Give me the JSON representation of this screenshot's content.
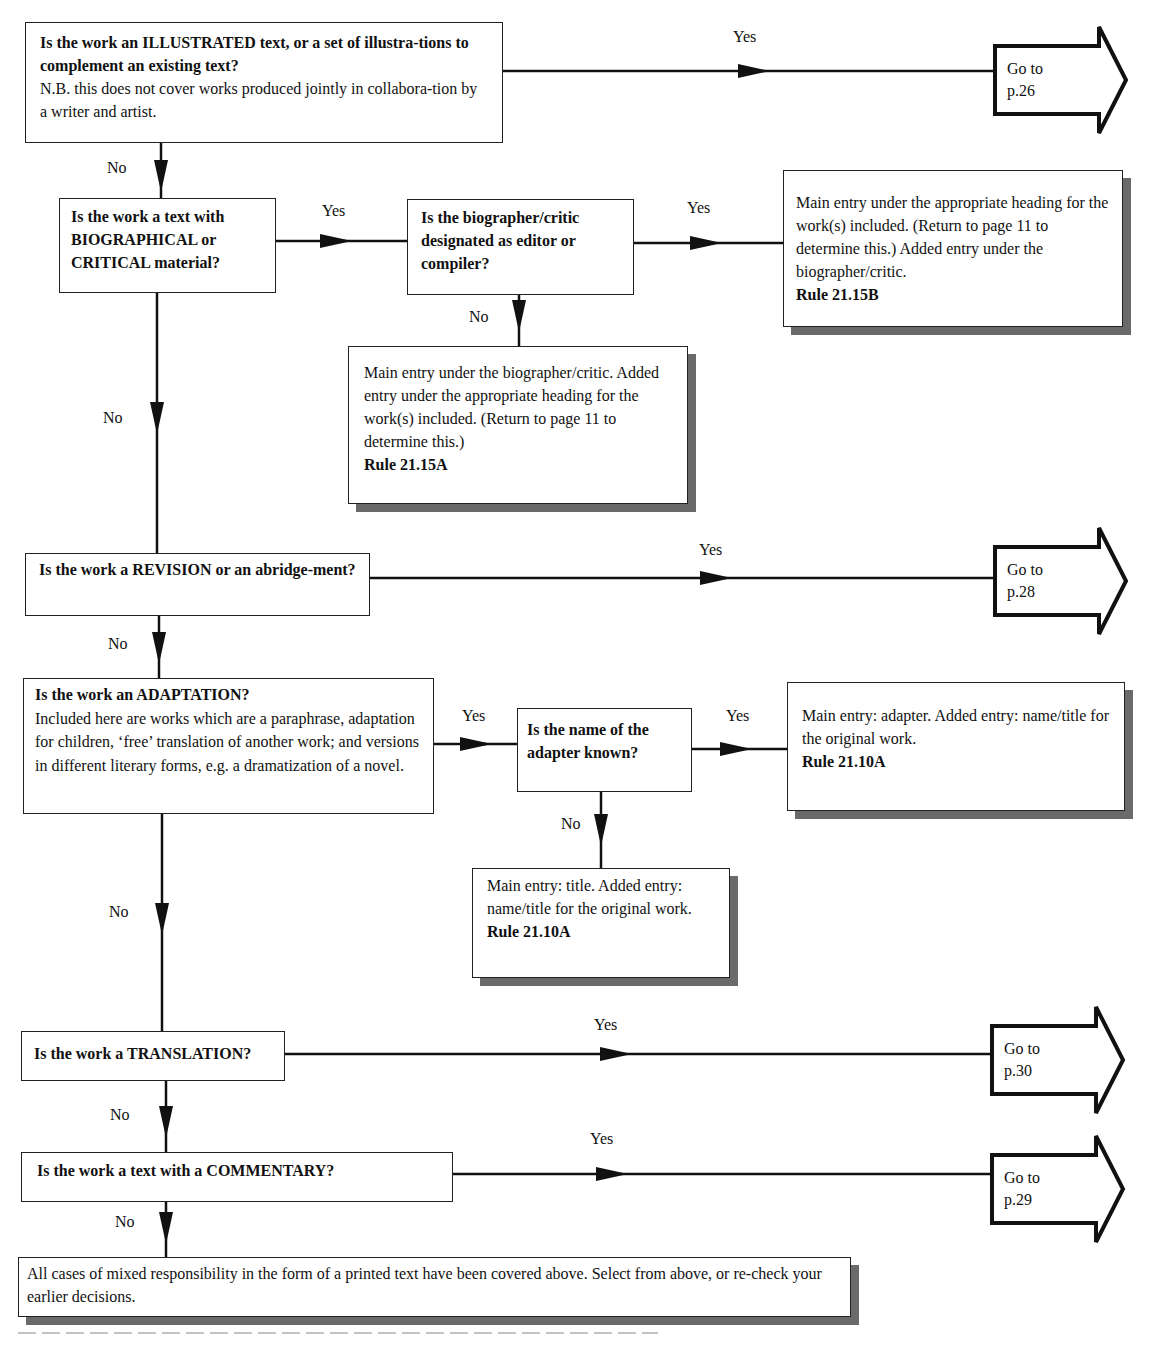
{
  "flowchart": {
    "nodes": {
      "illustrated": {
        "question": "Is the work  an ILLUSTRATED text, or a set of illustra-tions to complement an existing text?",
        "note": "N.B. this does not cover works produced jointly in collabora-tion by a writer and artist."
      },
      "biographical": {
        "question": "Is the work a text with BIOGRAPHICAL or CRITICAL material?"
      },
      "biographer_editor": {
        "question": "Is the biographer/critic designated as editor or compiler?"
      },
      "rule_21_15B": {
        "text": "Main entry under the appropriate heading for the work(s) included. (Return to page 11 to determine this.) Added entry under the biographer/critic.",
        "rule": "Rule 21.15B"
      },
      "rule_21_15A": {
        "text": "Main entry under the biographer/critic. Added entry under the appropriate heading for the work(s) included. (Return to page 11 to determine this.)",
        "rule": "Rule 21.15A"
      },
      "revision": {
        "question": "Is the work a REVISION or an abridge-ment?"
      },
      "adaptation": {
        "question": "Is the work an ADAPTATION?",
        "note": "Included here are works which are a paraphrase, adaptation for children, ‘free’ translation of another work; and versions in different literary forms, e.g. a dramatization of a novel."
      },
      "adapter_known": {
        "question": "Is the name of the adapter known?"
      },
      "rule_21_10A_adapter": {
        "text": "Main entry: adapter. Added entry: name/title for the original work.",
        "rule": "Rule 21.10A"
      },
      "rule_21_10A_title": {
        "text": "Main entry: title. Added entry: name/title for the original work.",
        "rule": "Rule 21.10A"
      },
      "translation": {
        "question": "Is the work a TRANSLATION?"
      },
      "commentary": {
        "question": "Is the work a text with a COMMENTARY?"
      },
      "all_covered": {
        "text": "All cases of mixed responsibility in the form of a printed text have been covered above. Select from  above, or re-check your earlier decisions."
      }
    },
    "goto": {
      "p26": {
        "line1": "Go to",
        "line2": "p.26"
      },
      "p28": {
        "line1": "Go to",
        "line2": "p.28"
      },
      "p30": {
        "line1": "Go to",
        "line2": "p.30"
      },
      "p29": {
        "line1": "Go to",
        "line2": "p.29"
      }
    },
    "labels": {
      "yes": "Yes",
      "no": "No"
    }
  }
}
